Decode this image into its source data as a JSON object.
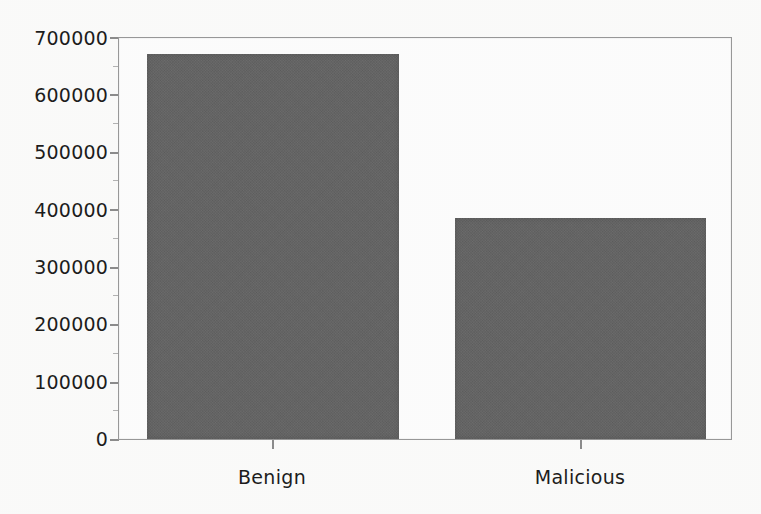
{
  "chart_data": {
    "type": "bar",
    "title": "",
    "subtitle": "",
    "xlabel": "",
    "ylabel": "",
    "categories": [
      "Benign",
      "Malicious"
    ],
    "values": [
      672000,
      385000
    ],
    "ylim": [
      0,
      700000
    ],
    "yticks": [
      0,
      100000,
      200000,
      300000,
      400000,
      500000,
      600000,
      700000
    ],
    "ytick_labels": [
      "0",
      "100000",
      "200000",
      "300000",
      "400000",
      "500000",
      "600000",
      "700000"
    ],
    "grid": false,
    "legend": null,
    "legend_position": "none",
    "bar_color": "#636363",
    "frame_color": "#9a9a9a",
    "background_color": "#ffffff"
  },
  "axes": {
    "y": {
      "ticks": [
        {
          "label": "700000",
          "value": 700000
        },
        {
          "label": "600000",
          "value": 600000
        },
        {
          "label": "500000",
          "value": 500000
        },
        {
          "label": "400000",
          "value": 400000
        },
        {
          "label": "300000",
          "value": 300000
        },
        {
          "label": "200000",
          "value": 200000
        },
        {
          "label": "100000",
          "value": 100000
        },
        {
          "label": "0",
          "value": 0
        }
      ]
    },
    "x": {
      "ticks": [
        {
          "label": "Benign"
        },
        {
          "label": "Malicious"
        }
      ]
    }
  }
}
